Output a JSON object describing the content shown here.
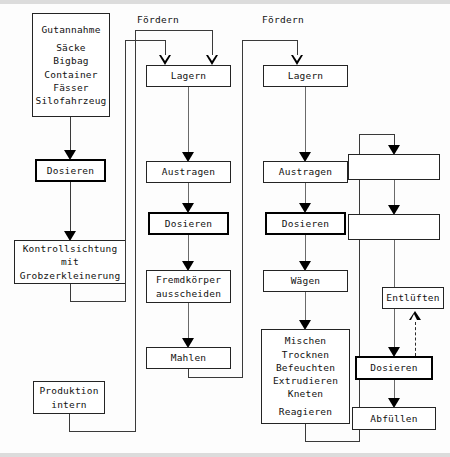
{
  "diagram": {
    "column_labels": [
      {
        "id": "foerdern-2",
        "text": "Fördern"
      },
      {
        "id": "foerdern-3",
        "text": "Fördern"
      }
    ],
    "nodes": {
      "gutannahme": {
        "lines": [
          "Gutannahme",
          "",
          "Säcke",
          "Bigbag",
          "Container",
          "Fässer",
          "Silofahrzeug"
        ],
        "header": "Gutannahme",
        "items": [
          "Säcke",
          "Bigbag",
          "Container",
          "Fässer",
          "Silofahrzeug"
        ]
      },
      "dosieren_1": {
        "text": "Dosieren",
        "emphasis": "thick"
      },
      "kontrollsichtung": {
        "lines": [
          "Kontrollsichtung",
          "mit",
          "Grobzerkleinerung"
        ]
      },
      "produktion_intern": {
        "lines": [
          "Produktion",
          "intern"
        ]
      },
      "lagern_2": {
        "text": "Lagern"
      },
      "austragen_2": {
        "text": "Austragen"
      },
      "dosieren_2": {
        "text": "Dosieren",
        "emphasis": "thick"
      },
      "fremdkoerper": {
        "lines": [
          "Fremdkörper",
          "ausscheiden"
        ]
      },
      "mahlen": {
        "text": "Mahlen"
      },
      "lagern_3": {
        "text": "Lagern"
      },
      "austragen_3": {
        "text": "Austragen"
      },
      "dosieren_3": {
        "text": "Dosieren",
        "emphasis": "thick"
      },
      "waegen": {
        "text": "Wägen"
      },
      "prozess": {
        "lines": [
          "Mischen",
          "Trocknen",
          "Befeuchten",
          "Extrudieren",
          "Kneten",
          "",
          "Reagieren"
        ],
        "items": [
          "Mischen",
          "Trocknen",
          "Befeuchten",
          "Extrudieren",
          "Kneten",
          "Reagieren"
        ]
      },
      "blank_1": {
        "text": ""
      },
      "blank_2": {
        "text": ""
      },
      "entlueften": {
        "text": "Entlüften"
      },
      "dosieren_4": {
        "text": "Dosieren",
        "emphasis": "thick"
      },
      "abfuellen": {
        "text": "Abfüllen"
      }
    },
    "colors": {
      "ink": "#111111",
      "line": "#3a3a3a",
      "paper": "#ffffff",
      "emphasis_border": "#000000"
    }
  }
}
